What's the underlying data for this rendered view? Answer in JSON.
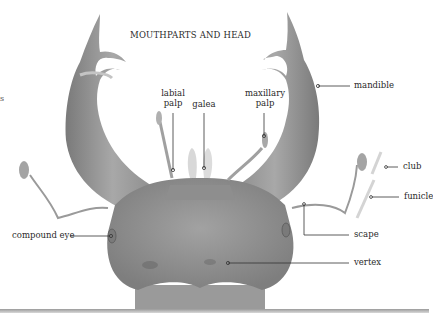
{
  "title": "MOUTHPARTS AND HEAD",
  "edge_text": "s",
  "labels": {
    "labial_palp": [
      "labial",
      "palp"
    ],
    "galea": "galea",
    "maxillary_palp": [
      "maxillary",
      "palp"
    ],
    "mandible": "mandible",
    "club": "club",
    "funicle": "funicle",
    "compound_eye": "compound eye",
    "scape": "scape",
    "vertex": "vertex"
  },
  "colors": {
    "body_fill": "#8a8a8a",
    "body_light": "#b4b4b4",
    "body_dark": "#6c6c6c",
    "leader_line": "#333333",
    "highlight_bar": "#d4d4d4",
    "text": "#2a2a2a"
  }
}
